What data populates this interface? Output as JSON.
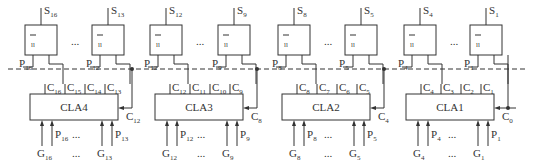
{
  "diagram": {
    "sum_gates": [
      {
        "id": "S16",
        "label": "S",
        "sub": "16",
        "x": 25,
        "p_label": "P",
        "p_sub": "16"
      },
      {
        "id": "S13",
        "label": "S",
        "sub": "13",
        "x": 92,
        "p_label": "P",
        "p_sub": "12"
      },
      {
        "id": "S12",
        "label": "S",
        "sub": "12",
        "x": 150,
        "p_label": "P",
        "p_sub": "12"
      },
      {
        "id": "S9",
        "label": "S",
        "sub": "9",
        "x": 218,
        "p_label": "P",
        "p_sub": "9"
      },
      {
        "id": "S8",
        "label": "S",
        "sub": "8",
        "x": 278,
        "p_label": "P",
        "p_sub": "8"
      },
      {
        "id": "S5",
        "label": "S",
        "sub": "5",
        "x": 345,
        "p_label": "P",
        "p_sub": "5"
      },
      {
        "id": "S4",
        "label": "S",
        "sub": "4",
        "x": 404,
        "p_label": "P",
        "p_sub": "4"
      },
      {
        "id": "S1",
        "label": "S",
        "sub": "1",
        "x": 470,
        "p_label": "P",
        "p_sub": "1"
      }
    ],
    "xor_symbol": "=1",
    "ellipsis": "...",
    "cla_blocks": [
      {
        "id": "CLA4",
        "label": "CLA4",
        "x": 30,
        "carries": [
          "C16",
          "C15",
          "C14",
          "C13"
        ],
        "cin": "C12",
        "inputs_left": [
          [
            "G",
            "16"
          ],
          [
            "P",
            "16"
          ]
        ],
        "inputs_right": [
          [
            "G",
            "13"
          ],
          [
            "P",
            "13"
          ]
        ]
      },
      {
        "id": "CLA3",
        "label": "CLA3",
        "x": 155,
        "carries": [
          "C12",
          "C11",
          "C10",
          "C9"
        ],
        "cin": "C8",
        "inputs_left": [
          [
            "G",
            "12"
          ],
          [
            "P",
            "12"
          ]
        ],
        "inputs_right": [
          [
            "G",
            "9"
          ],
          [
            "P",
            "9"
          ]
        ]
      },
      {
        "id": "CLA2",
        "label": "CLA2",
        "x": 282,
        "carries": [
          "C8",
          "C7",
          "C6",
          "C5"
        ],
        "cin": "C4",
        "inputs_left": [
          [
            "G",
            "8"
          ],
          [
            "P",
            "8"
          ]
        ],
        "inputs_right": [
          [
            "G",
            "5"
          ],
          [
            "P",
            "5"
          ]
        ]
      },
      {
        "id": "CLA1",
        "label": "CLA1",
        "x": 406,
        "carries": [
          "C4",
          "C3",
          "C2",
          "C1"
        ],
        "cin": "C0",
        "inputs_left": [
          [
            "G",
            "4"
          ],
          [
            "P",
            "4"
          ]
        ],
        "inputs_right": [
          [
            "G",
            "1"
          ],
          [
            "P",
            "1"
          ]
        ]
      }
    ],
    "labels": {
      "cla4": "CLA4",
      "cla3": "CLA3",
      "cla2": "CLA2",
      "cla1": "CLA1",
      "c0": "C",
      "c0_sub": "0",
      "c4": "C",
      "c4_sub": "4",
      "c8": "C",
      "c8_sub": "8",
      "c12": "C",
      "c12_sub": "12"
    }
  }
}
